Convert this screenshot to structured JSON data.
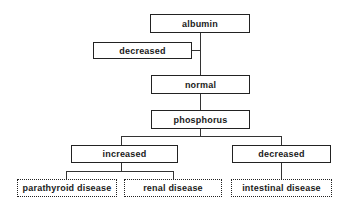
{
  "diagram": {
    "type": "decision-tree",
    "nodes": {
      "albumin": "albumin",
      "albumin_decreased": "decreased",
      "albumin_normal": "normal",
      "phosphorus": "phosphorus",
      "phosphorus_increased": "increased",
      "phosphorus_decreased": "decreased",
      "parathyroid": "parathyroid disease",
      "renal": "renal disease",
      "intestinal": "intestinal disease"
    },
    "edges": [
      [
        "albumin",
        "albumin_decreased"
      ],
      [
        "albumin",
        "albumin_normal"
      ],
      [
        "albumin_normal",
        "phosphorus"
      ],
      [
        "phosphorus",
        "phosphorus_increased"
      ],
      [
        "phosphorus",
        "phosphorus_decreased"
      ],
      [
        "phosphorus_increased",
        "parathyroid"
      ],
      [
        "phosphorus_increased",
        "renal"
      ],
      [
        "phosphorus_decreased",
        "intestinal"
      ]
    ],
    "colors": {
      "line": "#333333",
      "border": "#222222",
      "text": "#1a1a1a",
      "background": "#ffffff"
    }
  }
}
